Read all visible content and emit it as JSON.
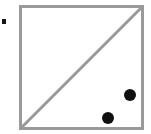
{
  "figure": {
    "title": "Square with diagonal and two filled points",
    "background_color": "#ffffff",
    "width": 151,
    "height": 134,
    "caption": ""
  },
  "square": {
    "name": "square-outline",
    "stroke_color": "#9a9a9a",
    "stroke_width": 3,
    "fill_color": "#ffffff",
    "left": 20.5,
    "top": 6.5,
    "right": 142.5,
    "bottom": 128.5,
    "side_length": 122
  },
  "diagonal": {
    "name": "diagonal-line",
    "stroke_color": "#9a9a9a",
    "stroke_width": 3,
    "x1": 21,
    "y1": 128,
    "x2": 142,
    "y2": 7,
    "direction": "bottom-left to top-right"
  },
  "points": [
    {
      "label": "point-upper",
      "cx": 130,
      "cy": 95,
      "r": 6,
      "color": "#111111"
    },
    {
      "label": "point-lower",
      "cx": 108,
      "cy": 118,
      "r": 6,
      "color": "#111111"
    }
  ],
  "marker": {
    "name": "left-edge-marker",
    "x": 2,
    "y": 19,
    "width": 4,
    "height": 5,
    "color": "#161616"
  }
}
